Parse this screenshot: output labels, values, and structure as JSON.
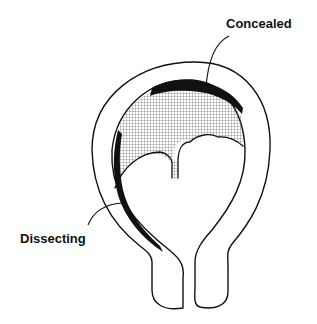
{
  "diagram": {
    "labels": {
      "concealed": "Concealed",
      "dissecting": "Dissecting"
    },
    "colors": {
      "background": "#ffffff",
      "outline": "#111111",
      "hemorrhage_fill": "#111111",
      "hatch": "#555555"
    }
  }
}
